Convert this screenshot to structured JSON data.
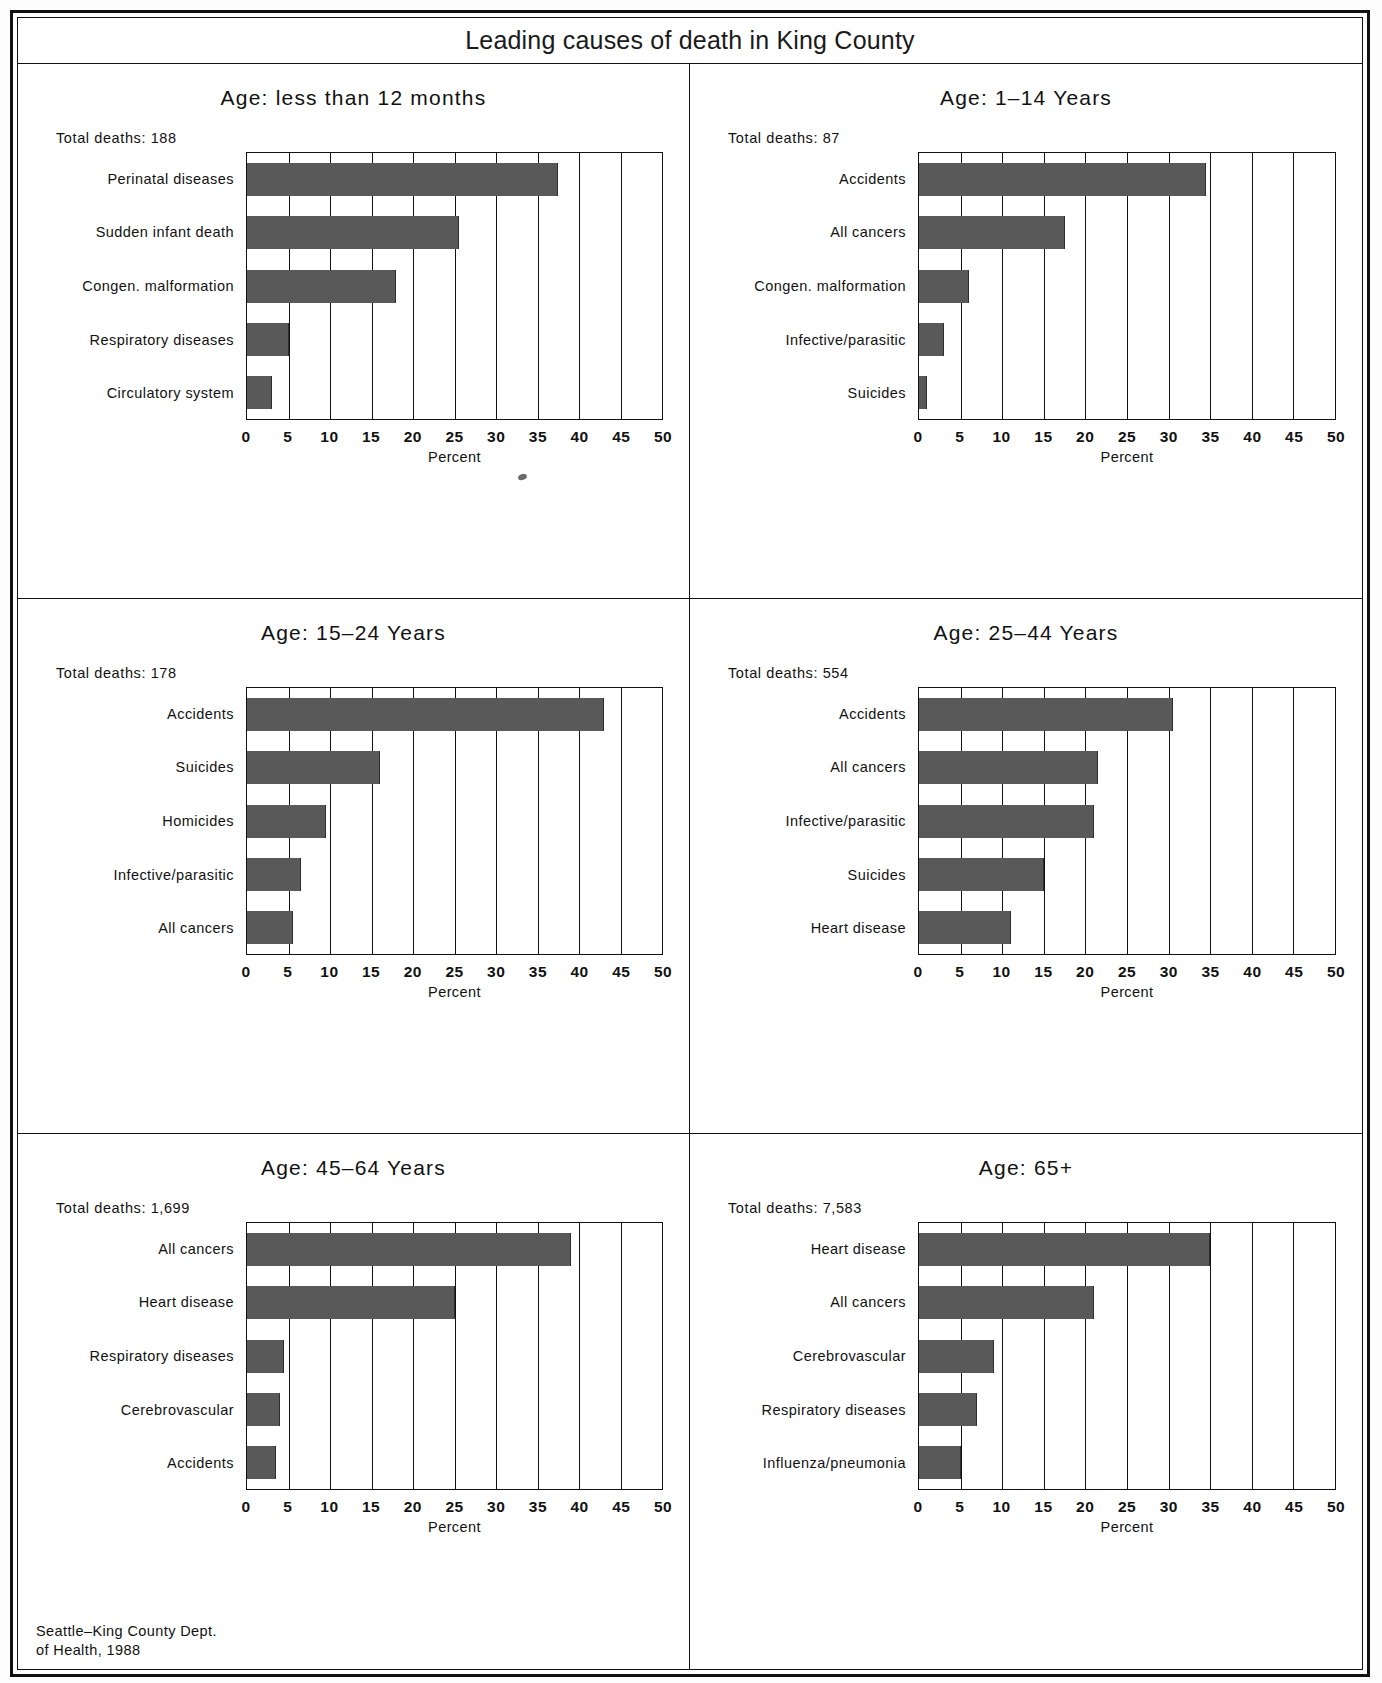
{
  "page": {
    "title": "Leading causes of death in King County",
    "source_note": "Seattle–King County Dept.\nof Health, 1988"
  },
  "axis": {
    "title": "Percent",
    "ticks": [
      "0",
      "5",
      "10",
      "15",
      "20",
      "25",
      "30",
      "35",
      "40",
      "45",
      "50"
    ],
    "min": 0,
    "max": 50,
    "step": 5
  },
  "labels": {
    "total_prefix": "Total deaths:"
  },
  "colors": {
    "bar_fill": "#595959",
    "axis_line": "#111111",
    "background": "#ffffff"
  },
  "chart_data": [
    {
      "type": "bar",
      "orientation": "horizontal",
      "title": "Age: less than 12 months",
      "total_deaths": "188",
      "total_deaths_label": "Total deaths: 188",
      "categories": [
        "Perinatal diseases",
        "Sudden infant death",
        "Congen. malformation",
        "Respiratory diseases",
        "Circulatory system"
      ],
      "values": [
        37.5,
        25.5,
        18,
        5,
        3
      ],
      "xlabel": "Percent",
      "ylabel": "",
      "xlim": [
        0,
        50
      ],
      "grid": true,
      "legend": "none"
    },
    {
      "type": "bar",
      "orientation": "horizontal",
      "title": "Age: 1–14 Years",
      "total_deaths": "87",
      "total_deaths_label": "Total deaths: 87",
      "categories": [
        "Accidents",
        "All cancers",
        "Congen. malformation",
        "Infective/parasitic",
        "Suicides"
      ],
      "values": [
        34.5,
        17.5,
        6,
        3,
        1
      ],
      "xlabel": "Percent",
      "ylabel": "",
      "xlim": [
        0,
        50
      ],
      "grid": true,
      "legend": "none"
    },
    {
      "type": "bar",
      "orientation": "horizontal",
      "title": "Age: 15–24 Years",
      "total_deaths": "178",
      "total_deaths_label": "Total deaths: 178",
      "categories": [
        "Accidents",
        "Suicides",
        "Homicides",
        "Infective/parasitic",
        "All cancers"
      ],
      "values": [
        43,
        16,
        9.5,
        6.5,
        5.5
      ],
      "xlabel": "Percent",
      "ylabel": "",
      "xlim": [
        0,
        50
      ],
      "grid": true,
      "legend": "none"
    },
    {
      "type": "bar",
      "orientation": "horizontal",
      "title": "Age: 25–44 Years",
      "total_deaths": "554",
      "total_deaths_label": "Total deaths: 554",
      "categories": [
        "Accidents",
        "All cancers",
        "Infective/parasitic",
        "Suicides",
        "Heart disease"
      ],
      "values": [
        30.5,
        21.5,
        21,
        15,
        11
      ],
      "xlabel": "Percent",
      "ylabel": "",
      "xlim": [
        0,
        50
      ],
      "grid": true,
      "legend": "none"
    },
    {
      "type": "bar",
      "orientation": "horizontal",
      "title": "Age: 45–64 Years",
      "total_deaths": "1,699",
      "total_deaths_label": "Total deaths: 1,699",
      "categories": [
        "All cancers",
        "Heart disease",
        "Respiratory diseases",
        "Cerebrovascular",
        "Accidents"
      ],
      "values": [
        39,
        25,
        4.5,
        4,
        3.5
      ],
      "xlabel": "Percent",
      "ylabel": "",
      "xlim": [
        0,
        50
      ],
      "grid": true,
      "legend": "none"
    },
    {
      "type": "bar",
      "orientation": "horizontal",
      "title": "Age: 65+",
      "total_deaths": "7,583",
      "total_deaths_label": "Total deaths: 7,583",
      "categories": [
        "Heart disease",
        "All cancers",
        "Cerebrovascular",
        "Respiratory diseases",
        "Influenza/pneumonia"
      ],
      "values": [
        35,
        21,
        9,
        7,
        5
      ],
      "xlabel": "Percent",
      "ylabel": "",
      "xlim": [
        0,
        50
      ],
      "grid": true,
      "legend": "none"
    }
  ]
}
